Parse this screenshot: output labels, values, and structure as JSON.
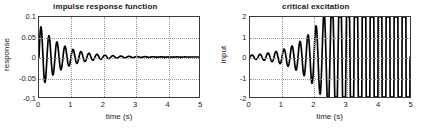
{
  "figure": {
    "background_color": "#ffffff",
    "trace_color": "#000000",
    "grid_color": "#9a9a9a",
    "axis_color": "#3a3a3a"
  },
  "chart_data": [
    {
      "type": "line",
      "title": "impulse response function",
      "xlabel": "time (s)",
      "ylabel": "response",
      "xlim": [
        0,
        5
      ],
      "ylim": [
        -0.1,
        0.1
      ],
      "xticks": [
        0,
        1,
        2,
        3,
        4,
        5
      ],
      "xticklabels": [
        "0",
        "1",
        "2",
        "3",
        "4",
        "5"
      ],
      "yticks": [
        0.1,
        0.05,
        0,
        -0.05,
        -0.1
      ],
      "yticklabels": [
        "0.1",
        "0.05",
        "0",
        "-0.05",
        "-0.1"
      ],
      "grid": true,
      "legend": null,
      "description": "Damped sinusoidal impulse response, frequency about 4 Hz, decaying envelope",
      "model": {
        "form": "A * exp(-zeta*w*t) * sin(w*t)",
        "amplitude": 0.082,
        "frequency_hz": 4.0,
        "damping_ratio": 0.055,
        "phase": 0
      },
      "series": [
        {
          "name": "impulse response",
          "x": [
            0,
            0.06,
            0.125,
            0.19,
            0.25,
            0.31,
            0.375,
            0.44,
            0.5,
            0.56,
            0.625,
            0.69,
            0.75,
            0.81,
            0.875,
            0.94,
            1.0,
            1.125,
            1.25,
            1.375,
            1.5,
            1.625,
            1.75,
            1.875,
            2.0,
            2.25,
            2.5,
            2.75,
            3.0,
            3.25,
            3.5,
            3.75,
            4.0,
            4.25,
            4.5,
            4.75,
            5.0
          ],
          "y": [
            0,
            0.072,
            0.0,
            -0.063,
            0.0,
            0.058,
            0.0,
            -0.051,
            0.0,
            0.046,
            0.0,
            -0.041,
            0.0,
            0.036,
            0.0,
            -0.032,
            0.0,
            0.026,
            0.0,
            -0.021,
            0.0,
            0.017,
            0.0,
            -0.014,
            0.0,
            0.0115,
            0.0,
            -0.0092,
            0.0,
            0.0074,
            0.0,
            -0.0059,
            0.0,
            0.0048,
            0.0,
            -0.0038,
            0.0
          ]
        }
      ],
      "peak_values": {
        "first_peak": 0.075,
        "first_trough": -0.063,
        "final_amplitude": 0.004
      }
    },
    {
      "type": "line",
      "title": "critical excitation",
      "xlabel": "time (s)",
      "ylabel": "input",
      "xlim": [
        0,
        5
      ],
      "ylim": [
        -2,
        2
      ],
      "xticks": [
        0,
        1,
        2,
        3,
        4,
        5
      ],
      "xticklabels": [
        "0",
        "1",
        "2",
        "3",
        "4",
        "5"
      ],
      "yticks": [
        2,
        1,
        0,
        -1,
        -2
      ],
      "yticklabels": [
        "2",
        "1",
        "0",
        "-1",
        "-2"
      ],
      "grid": true,
      "legend": null,
      "description": "Time-reversed impulse response: oscillation with exponentially growing envelope",
      "model": {
        "form": "A * exp(+zeta*w*t) * sin(w*t)",
        "amplitude_start": 0.09,
        "amplitude_end": 1.68,
        "frequency_hz": 4.0,
        "damping_ratio": 0.055
      },
      "series": [
        {
          "name": "critical excitation",
          "x": [
            0,
            0.125,
            0.25,
            0.375,
            0.5,
            0.625,
            0.75,
            0.875,
            1.0,
            1.25,
            1.5,
            1.75,
            2.0,
            2.25,
            2.5,
            2.75,
            3.0,
            3.25,
            3.5,
            3.75,
            4.0,
            4.125,
            4.25,
            4.375,
            4.5,
            4.625,
            4.75,
            4.875,
            5.0
          ],
          "y": [
            0,
            0.09,
            -0.1,
            0.11,
            -0.12,
            0.13,
            -0.14,
            0.16,
            -0.17,
            0.21,
            -0.25,
            0.3,
            -0.36,
            0.44,
            -0.53,
            0.64,
            -0.77,
            0.93,
            -1.1,
            1.25,
            -1.1,
            1.22,
            -1.5,
            1.42,
            -1.2,
            1.35,
            -1.45,
            1.66,
            0.4
          ]
        }
      ],
      "peak_values": {
        "final_peak": 1.68,
        "final_trough": -1.5,
        "initial_amplitude": 0.09
      }
    }
  ]
}
